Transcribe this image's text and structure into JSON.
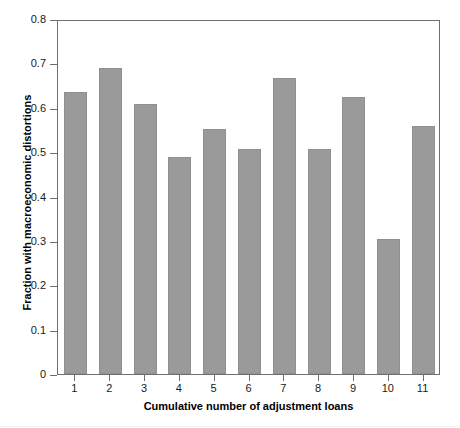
{
  "chart_data": {
    "type": "bar",
    "title": "",
    "xlabel": "Cumulative number of adjustment loans",
    "ylabel": "Fraction with macroeconomic distortions",
    "categories": [
      "1",
      "2",
      "3",
      "4",
      "5",
      "6",
      "7",
      "8",
      "9",
      "10",
      "11"
    ],
    "values": [
      0.635,
      0.69,
      0.608,
      0.49,
      0.552,
      0.507,
      0.668,
      0.506,
      0.625,
      0.305,
      0.558
    ],
    "ylim": [
      0,
      0.8
    ],
    "ytick_labels": [
      "0",
      "0.1",
      "0.2",
      "0.3",
      "0.4",
      "0.5",
      "0.6",
      "0.7",
      "0.8"
    ],
    "ytick_values": [
      0,
      0.1,
      0.2,
      0.3,
      0.4,
      0.5,
      0.6,
      0.7,
      0.8
    ],
    "grid": false,
    "legend": null,
    "bar_color": "#9a9a9a",
    "axis_color": "#6f6f6f",
    "series": [
      {
        "name": "Fraction with macroeconomic distortions",
        "values": [
          0.635,
          0.69,
          0.608,
          0.49,
          0.552,
          0.507,
          0.668,
          0.506,
          0.625,
          0.305,
          0.558
        ]
      }
    ]
  }
}
